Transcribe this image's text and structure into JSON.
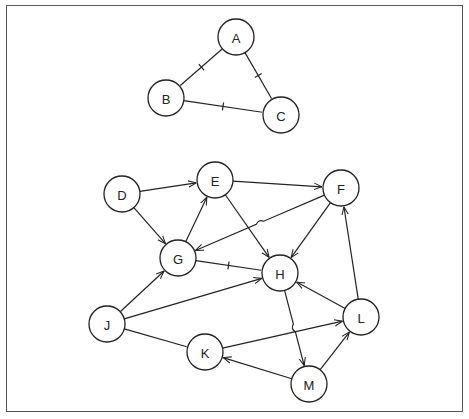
{
  "diagram": {
    "type": "graph",
    "style": {
      "stroke": "#222222",
      "node_fill": "#ffffff",
      "frame": "#555555",
      "node_radius": 18
    },
    "nodes": [
      {
        "id": "A",
        "label": "A",
        "x": 236,
        "y": 37
      },
      {
        "id": "B",
        "label": "B",
        "x": 166,
        "y": 98
      },
      {
        "id": "C",
        "label": "C",
        "x": 281,
        "y": 115
      },
      {
        "id": "D",
        "label": "D",
        "x": 122,
        "y": 194
      },
      {
        "id": "E",
        "label": "E",
        "x": 215,
        "y": 180
      },
      {
        "id": "F",
        "label": "F",
        "x": 341,
        "y": 188
      },
      {
        "id": "G",
        "label": "G",
        "x": 178,
        "y": 258
      },
      {
        "id": "H",
        "label": "H",
        "x": 280,
        "y": 273
      },
      {
        "id": "J",
        "label": "J",
        "x": 107,
        "y": 324
      },
      {
        "id": "K",
        "label": "K",
        "x": 205,
        "y": 352
      },
      {
        "id": "L",
        "label": "L",
        "x": 361,
        "y": 317
      },
      {
        "id": "M",
        "label": "M",
        "x": 309,
        "y": 384
      }
    ],
    "edges": [
      {
        "from": "A",
        "to": "B",
        "directed": false,
        "tick": true
      },
      {
        "from": "A",
        "to": "C",
        "directed": false,
        "tick": true
      },
      {
        "from": "B",
        "to": "C",
        "directed": false,
        "tick": true
      },
      {
        "from": "D",
        "to": "E",
        "directed": true
      },
      {
        "from": "D",
        "to": "G",
        "directed": true
      },
      {
        "from": "E",
        "to": "F",
        "directed": true
      },
      {
        "from": "E",
        "to": "H",
        "directed": true
      },
      {
        "from": "G",
        "to": "E",
        "directed": true
      },
      {
        "from": "F",
        "to": "G",
        "directed": true,
        "hop": true
      },
      {
        "from": "F",
        "to": "H",
        "directed": true
      },
      {
        "from": "G",
        "to": "H",
        "directed": false,
        "tick": true
      },
      {
        "from": "J",
        "to": "G",
        "directed": true
      },
      {
        "from": "J",
        "to": "H",
        "directed": true
      },
      {
        "from": "J",
        "to": "K",
        "directed": false
      },
      {
        "from": "K",
        "to": "L",
        "directed": true
      },
      {
        "from": "M",
        "to": "K",
        "directed": true
      },
      {
        "from": "M",
        "to": "L",
        "directed": true
      },
      {
        "from": "L",
        "to": "H",
        "directed": true
      },
      {
        "from": "L",
        "to": "F",
        "directed": true
      },
      {
        "from": "H",
        "to": "M",
        "directed": true,
        "hop": true
      }
    ]
  }
}
